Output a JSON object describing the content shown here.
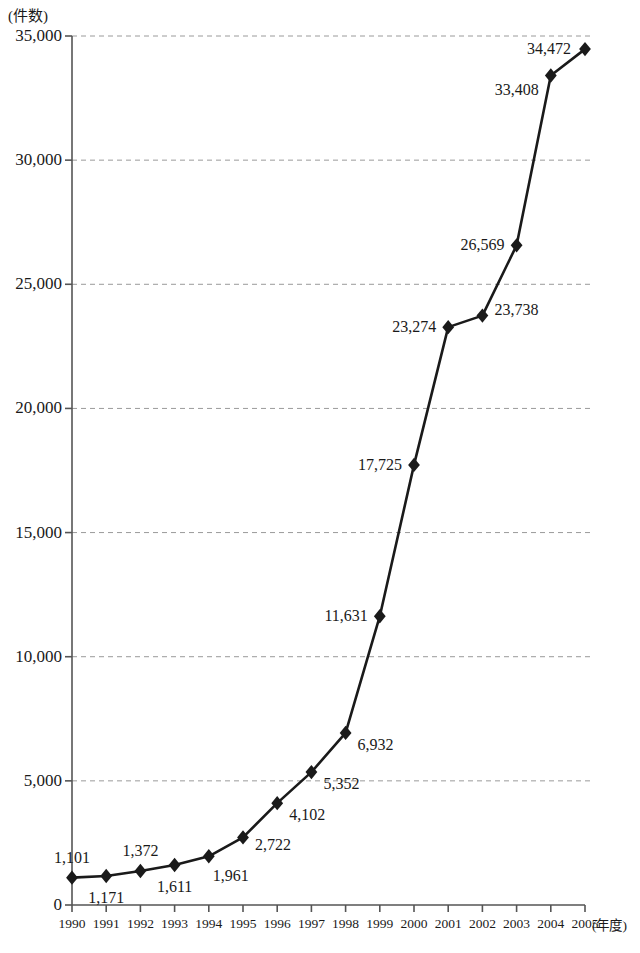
{
  "chart_data": {
    "type": "line",
    "title": "",
    "xlabel": "(年度)",
    "ylabel": "(件数)",
    "categories": [
      "1990",
      "1991",
      "1992",
      "1993",
      "1994",
      "1995",
      "1996",
      "1997",
      "1998",
      "1999",
      "2000",
      "2001",
      "2002",
      "2003",
      "2004",
      "2005"
    ],
    "values": [
      1101,
      1171,
      1372,
      1611,
      1961,
      2722,
      4102,
      5352,
      6932,
      11631,
      17725,
      23274,
      23738,
      26569,
      33408,
      34472
    ],
    "value_labels": [
      "1,101",
      "1,171",
      "1,372",
      "1,611",
      "1,961",
      "2,722",
      "4,102",
      "5,352",
      "6,932",
      "11,631",
      "17,725",
      "23,274",
      "23,738",
      "26,569",
      "33,408",
      "34,472"
    ],
    "label_placements": [
      "above",
      "below",
      "above",
      "below",
      "below-right",
      "right",
      "right",
      "right",
      "right",
      "left",
      "left",
      "left",
      "right",
      "left",
      "left",
      "left"
    ],
    "ylim": [
      0,
      35000
    ],
    "y_ticks": [
      0,
      5000,
      10000,
      15000,
      20000,
      25000,
      30000,
      35000
    ],
    "y_tick_labels": [
      "0",
      "5,000",
      "10,000",
      "15,000",
      "20,000",
      "25,000",
      "30,000",
      "35,000"
    ],
    "grid": "horizontal-dashed",
    "legend": "none",
    "marker": "diamond",
    "line_color": "#1a1a1a",
    "marker_color": "#1a1a1a",
    "grid_color": "#9a9a9a",
    "axis_color": "#555555",
    "background_color": "#ffffff"
  }
}
